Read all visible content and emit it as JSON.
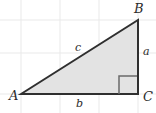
{
  "figure": {
    "background_color": "#ffffff",
    "grid": {
      "visible": true,
      "color": "#e9e9e9",
      "line_width": 1,
      "vertical_lines_x": [
        21,
        60,
        99,
        138
      ],
      "horizontal_lines_y": [
        20,
        53,
        94
      ]
    },
    "triangle": {
      "fill_color": "#e3e3e3",
      "stroke_color": "#2f2f2f",
      "stroke_width": 2,
      "vertices": [
        {
          "name": "A",
          "x": 21,
          "y": 94
        },
        {
          "name": "B",
          "x": 138,
          "y": 20
        },
        {
          "name": "C",
          "x": 138,
          "y": 94
        }
      ]
    },
    "right_angle_marker": {
      "at_vertex": "C",
      "size": 18,
      "stroke_color": "#6b6b6b",
      "stroke_width": 1.5,
      "x": 119,
      "y": 76
    },
    "vertex_labels": [
      {
        "text": "A",
        "x": 9,
        "y": 100
      },
      {
        "text": "B",
        "x": 134,
        "y": 13
      },
      {
        "text": "C",
        "x": 143,
        "y": 101
      }
    ],
    "side_labels": [
      {
        "text": "a",
        "side": "BC",
        "x": 143,
        "y": 55
      },
      {
        "text": "b",
        "side": "AC",
        "x": 76,
        "y": 107
      },
      {
        "text": "c",
        "side": "AB",
        "x": 75,
        "y": 51
      }
    ]
  }
}
